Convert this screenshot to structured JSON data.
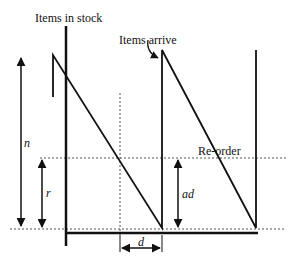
{
  "diagram": {
    "type": "inventory-sawtooth",
    "labels": {
      "stock_axis": "Items in stock",
      "arrival": "Items arrive",
      "reorder": "Re-order",
      "n": "n",
      "r": "r",
      "ad": "ad",
      "d": "d"
    },
    "colors": {
      "line": "#111111",
      "dotted": "#555555",
      "background": "#ffffff"
    }
  }
}
